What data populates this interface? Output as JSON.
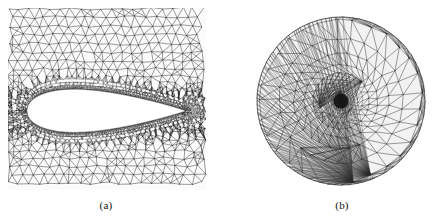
{
  "figure": {
    "background_color": "#ffffff",
    "mesh_line_color": "#2b2b2b",
    "panel_count": 2
  },
  "panels": [
    {
      "id": "a",
      "caption": "(a)",
      "kind": "airfoil-mesh",
      "domain_shape": "rectangle",
      "description": "Unstructured triangular mesh around an airfoil in a rectangular far-field box, graded from coarse at the outer boundary to very fine at the airfoil surface",
      "body_name": "airfoil",
      "body_fill": "#ffffff",
      "bounds_px": {
        "x": 8,
        "y": 8,
        "width": 198,
        "height": 182
      }
    },
    {
      "id": "b",
      "caption": "(b)",
      "kind": "circular-mesh",
      "domain_shape": "circle",
      "description": "Unstructured triangular mesh on a circular disk, radially graded from coarse at the outer rim to extremely fine at the central singular point",
      "center_px": {
        "x": 86,
        "y": 92
      },
      "radius_px": 84,
      "bounds_px": {
        "x": 255,
        "y": 9,
        "width": 174,
        "height": 184
      }
    }
  ],
  "mesh_a": {
    "type": "triangular-unstructured",
    "columns": 82,
    "rows": 74,
    "refinement": "boundary-layer-clustered",
    "airfoil": {
      "profile": "NACA-symmetric",
      "chord_fraction": 0.8,
      "thickness_fraction": 0.09,
      "leading_edge_x": 0.095,
      "trailing_edge_x": 0.895,
      "center_y": 0.565,
      "leading_edge_shape": "rounded",
      "trailing_edge_shape": "sharp"
    },
    "grading": {
      "near_field_density": 1.0,
      "far_field_density": 0.16,
      "wake_density": 0.55
    }
  },
  "mesh_b": {
    "type": "triangular-radial",
    "rings": 30,
    "base_sectors": 36,
    "refinement": "center-clustered",
    "radial_growth": 1.3,
    "grading": {
      "center_density": 1.0,
      "rim_density": 0.1
    }
  },
  "captions": {
    "a": "(a)",
    "b": "(b)"
  }
}
